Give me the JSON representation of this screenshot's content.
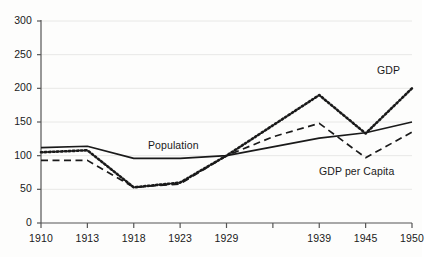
{
  "chart_data": {
    "type": "line",
    "title": "",
    "xlabel": "",
    "ylabel": "",
    "categories": [
      "1910",
      "1913",
      "1918",
      "1923",
      "1929",
      "",
      "1939",
      "1945",
      "1950"
    ],
    "tick_labels_visible": [
      "1910",
      "1913",
      "1918",
      "1923",
      "1929",
      "1939",
      "1945",
      "1950"
    ],
    "ylim": [
      0,
      300
    ],
    "yticks": [
      0,
      50,
      100,
      150,
      200,
      250,
      300
    ],
    "ytick_labels": [
      "0",
      "50",
      "100",
      "150",
      "200",
      "250",
      "300"
    ],
    "grid": true,
    "grid_axis": "y",
    "legend": "inline-labels",
    "series": [
      {
        "name": "Population",
        "style": "solid",
        "color": "#1a1a1a",
        "values": [
          112,
          114,
          96,
          96,
          100,
          113,
          126,
          134,
          150
        ]
      },
      {
        "name": "GDP",
        "style": "dotted",
        "color": "#1a1a1a",
        "values": [
          105,
          108,
          53,
          60,
          100,
          145,
          190,
          133,
          200
        ]
      },
      {
        "name": "GDP per Capita",
        "style": "dashed",
        "color": "#1a1a1a",
        "values": [
          93,
          93,
          53,
          58,
          100,
          128,
          148,
          97,
          135
        ]
      }
    ],
    "annotations": [
      {
        "text": "Population",
        "x_px": 148,
        "y_px": 139
      },
      {
        "text": "GDP",
        "x_px": 377,
        "y_px": 64
      },
      {
        "text": "GDP per Capita",
        "x_px": 319,
        "y_px": 165
      }
    ]
  },
  "colors": {
    "line": "#1a1a1a",
    "axis": "#555555",
    "grid": "#e8e8e6",
    "text": "#1a1a1a",
    "background": "#fdfdfc"
  }
}
